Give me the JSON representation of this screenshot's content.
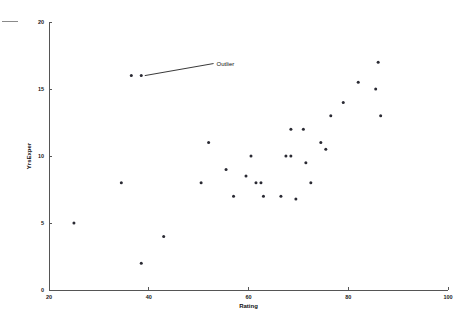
{
  "chart_data": {
    "type": "scatter",
    "title": "",
    "xlabel": "Rating",
    "ylabel": "YrsExper",
    "xlim": [
      20,
      100
    ],
    "ylim": [
      0,
      20
    ],
    "xticks": [
      20,
      40,
      60,
      80,
      100
    ],
    "yticks": [
      0,
      5,
      10,
      15,
      20
    ],
    "xtick_labels": [
      "20",
      "40",
      "60",
      "80",
      "100"
    ],
    "ytick_labels": [
      "0",
      "5",
      "10",
      "15",
      "20"
    ],
    "grid": false,
    "legend": null,
    "marker": "dot",
    "marker_color": "#2a2a33",
    "points": [
      {
        "x": 25.0,
        "y": 5.0
      },
      {
        "x": 34.5,
        "y": 8.0
      },
      {
        "x": 36.5,
        "y": 16.0
      },
      {
        "x": 38.5,
        "y": 16.0
      },
      {
        "x": 38.5,
        "y": 2.0
      },
      {
        "x": 43.0,
        "y": 4.0
      },
      {
        "x": 50.5,
        "y": 8.0
      },
      {
        "x": 52.0,
        "y": 11.0
      },
      {
        "x": 55.5,
        "y": 9.0
      },
      {
        "x": 57.0,
        "y": 7.0
      },
      {
        "x": 59.5,
        "y": 8.5
      },
      {
        "x": 60.5,
        "y": 10.0
      },
      {
        "x": 61.5,
        "y": 8.0
      },
      {
        "x": 62.5,
        "y": 8.0
      },
      {
        "x": 63.0,
        "y": 7.0
      },
      {
        "x": 66.5,
        "y": 7.0
      },
      {
        "x": 67.5,
        "y": 10.0
      },
      {
        "x": 68.5,
        "y": 12.0
      },
      {
        "x": 68.5,
        "y": 10.0
      },
      {
        "x": 69.5,
        "y": 6.8
      },
      {
        "x": 71.0,
        "y": 12.0
      },
      {
        "x": 71.5,
        "y": 9.5
      },
      {
        "x": 72.5,
        "y": 8.0
      },
      {
        "x": 74.5,
        "y": 11.0
      },
      {
        "x": 75.5,
        "y": 10.5
      },
      {
        "x": 76.5,
        "y": 13.0
      },
      {
        "x": 79.0,
        "y": 14.0
      },
      {
        "x": 82.0,
        "y": 15.5
      },
      {
        "x": 85.5,
        "y": 15.0
      },
      {
        "x": 86.0,
        "y": 17.0
      },
      {
        "x": 86.5,
        "y": 13.0
      }
    ],
    "annotations": [
      {
        "text": "Outlier",
        "point_x": 38.5,
        "point_y": 16.0,
        "label_x": 53.0,
        "label_y": 16.9
      }
    ]
  }
}
